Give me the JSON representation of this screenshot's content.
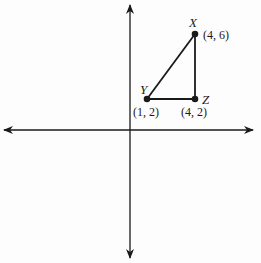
{
  "diagram": {
    "type": "coordinate-plane-triangle",
    "axes": {
      "x_axis": "horizontal number line with arrows on both ends",
      "y_axis": "vertical number line with arrows on both ends"
    },
    "points": [
      {
        "name": "X",
        "coord_label": "(4, 6)",
        "x": 4,
        "y": 6
      },
      {
        "name": "Y",
        "coord_label": "(1, 2)",
        "x": 1,
        "y": 2
      },
      {
        "name": "Z",
        "coord_label": "(4, 2)",
        "x": 4,
        "y": 2
      }
    ],
    "segments": [
      {
        "from": "X",
        "to": "Y"
      },
      {
        "from": "Y",
        "to": "Z"
      },
      {
        "from": "Z",
        "to": "X"
      }
    ],
    "colors": {
      "stroke": "#1a1a1a",
      "background": "#fdfdfd"
    }
  }
}
